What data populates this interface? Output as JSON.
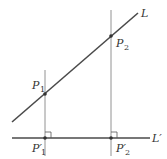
{
  "diagram": {
    "colors": {
      "background": "#ffffff",
      "thick_line": "#4a4a4a",
      "thin_line": "#777777",
      "text": "#333333"
    },
    "lines": {
      "L": {
        "label": "L",
        "x1": 12,
        "y1": 122,
        "x2": 138,
        "y2": 13
      },
      "L_prime": {
        "label": "L",
        "prime": "′",
        "x1": 12,
        "y1": 138,
        "x2": 150,
        "y2": 138
      },
      "perp_1": {
        "x": 45,
        "y1": 70,
        "y2": 156
      },
      "perp_2": {
        "x": 111,
        "y1": 10,
        "y2": 156
      }
    },
    "points": [
      {
        "name": "P",
        "sub": "1",
        "prime": "",
        "x": 45,
        "y": 94
      },
      {
        "name": "P",
        "sub": "2",
        "prime": "",
        "x": 111,
        "y": 36
      },
      {
        "name": "P",
        "sub": "1",
        "prime": "′",
        "x": 45,
        "y": 138
      },
      {
        "name": "P",
        "sub": "2",
        "prime": "′",
        "x": 111,
        "y": 138
      }
    ],
    "labels": {
      "L": "L",
      "L_prime": "L′",
      "P1": "P",
      "P1_sub": "1",
      "P2": "P",
      "P2_sub": "2",
      "P1p": "P′",
      "P1p_sub": "1",
      "P2p": "P′",
      "P2p_sub": "2"
    },
    "right_angle_markers": [
      {
        "at": "P1'",
        "size": 6
      },
      {
        "at": "P2'",
        "size": 6
      }
    ]
  }
}
